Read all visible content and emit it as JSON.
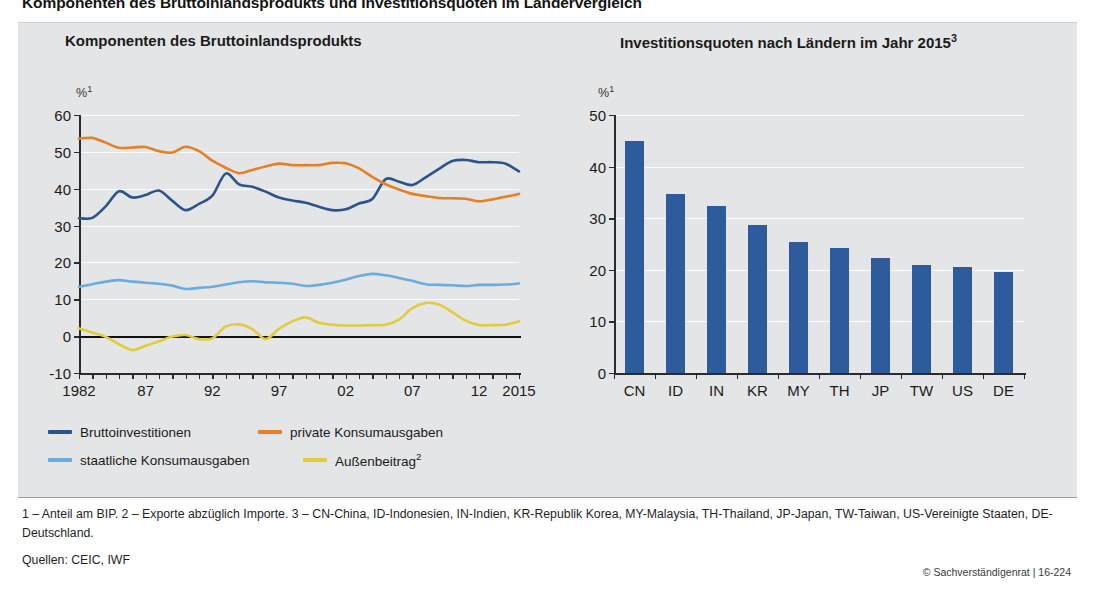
{
  "main_title": "Komponenten des Bruttoinlandsprodukts und Investitionsquoten im Ländervergleich",
  "footnotes": "1 – Anteil am BIP.  2 – Exporte abzüglich Importe.  3 – CN-China, ID-Indonesien, IN-Indien, KR-Republik Korea, MY-Malaysia, TH-Thailand, JP-Japan, TW-Taiwan, US-Vereinigte Staaten, DE-Deutschland.",
  "sources": "Quellen: CEIC, IWF",
  "copyright": "© Sachverständigenrat | 16-224",
  "colors": {
    "navy": "#2d5488",
    "orange": "#e58026",
    "light_blue": "#6cacdc",
    "yellow": "#e0cc3c",
    "bar": "#2e5b9c",
    "panel_bg": "#e4e5e6",
    "grid": "#fbfbfb",
    "axis": "#2b2b2b"
  },
  "legend": {
    "items": [
      {
        "label": "Bruttoinvestitionen",
        "color": "#2d5488"
      },
      {
        "label": "private Konsumausgaben",
        "color": "#e58026"
      },
      {
        "label": "staatliche Konsumausgaben",
        "color": "#6cacdc"
      },
      {
        "label": "Außenbeitrag",
        "sup": "2",
        "color": "#e0cc3c"
      }
    ]
  },
  "chart_data": [
    {
      "type": "line",
      "id": "left",
      "title": "Komponenten des Bruttoinlandsprodukts",
      "unit": "%",
      "unit_sup": "1",
      "xlabel": "",
      "ylabel": "",
      "ylim": [
        -10,
        60
      ],
      "yticks": [
        -10,
        0,
        10,
        20,
        30,
        40,
        50,
        60
      ],
      "xlim": [
        1982,
        2015
      ],
      "xticks": [
        1982,
        1987,
        1992,
        1997,
        2002,
        2007,
        2012,
        2015
      ],
      "xtick_labels": [
        "1982",
        "87",
        "92",
        "97",
        "02",
        "07",
        "12",
        "2015"
      ],
      "grid": true,
      "legend_position": "below",
      "x": [
        1982,
        1983,
        1984,
        1985,
        1986,
        1987,
        1988,
        1989,
        1990,
        1991,
        1992,
        1993,
        1994,
        1995,
        1996,
        1997,
        1998,
        1999,
        2000,
        2001,
        2002,
        2003,
        2004,
        2005,
        2006,
        2007,
        2008,
        2009,
        2010,
        2011,
        2012,
        2013,
        2014,
        2015
      ],
      "series": [
        {
          "name": "Bruttoinvestitionen",
          "color": "#2d5488",
          "values": [
            32.0,
            32.1,
            35.2,
            39.3,
            37.6,
            38.3,
            39.5,
            36.7,
            34.2,
            35.9,
            38.1,
            44.1,
            41.2,
            40.5,
            39.2,
            37.6,
            36.8,
            36.2,
            35.1,
            34.2,
            34.4,
            36.0,
            37.2,
            42.6,
            41.9,
            41.0,
            43.1,
            45.4,
            47.5,
            47.8,
            47.2,
            47.2,
            46.8,
            44.7
          ]
        },
        {
          "name": "private Konsumausgaben",
          "color": "#e58026",
          "values": [
            53.6,
            53.8,
            52.5,
            51.1,
            51.2,
            51.3,
            50.2,
            49.8,
            51.4,
            50.2,
            47.6,
            45.7,
            44.2,
            45.1,
            46.0,
            46.8,
            46.4,
            46.4,
            46.4,
            47.0,
            46.9,
            45.5,
            43.2,
            41.2,
            39.8,
            38.6,
            38.0,
            37.5,
            37.4,
            37.3,
            36.6,
            37.1,
            37.8,
            38.6
          ]
        },
        {
          "name": "staatliche Konsumausgaben",
          "color": "#6cacdc",
          "values": [
            13.4,
            14.1,
            14.8,
            15.2,
            14.8,
            14.5,
            14.2,
            13.7,
            12.8,
            13.1,
            13.4,
            14.0,
            14.6,
            14.9,
            14.6,
            14.5,
            14.2,
            13.6,
            13.9,
            14.5,
            15.3,
            16.3,
            16.9,
            16.5,
            15.8,
            15.0,
            14.1,
            13.9,
            13.8,
            13.6,
            13.9,
            13.9,
            14.0,
            14.3
          ]
        },
        {
          "name": "Außenbeitrag",
          "color": "#e0cc3c",
          "values": [
            2.1,
            1.0,
            -0.2,
            -2.2,
            -3.8,
            -2.6,
            -1.4,
            -0.1,
            0.3,
            -0.8,
            -0.6,
            2.6,
            3.2,
            1.9,
            -0.8,
            2.0,
            4.0,
            5.1,
            3.6,
            3.1,
            2.9,
            2.9,
            3.0,
            3.1,
            4.5,
            7.6,
            9.0,
            8.6,
            6.5,
            4.2,
            3.0,
            3.0,
            3.1,
            4.0
          ]
        }
      ]
    },
    {
      "type": "bar",
      "id": "right",
      "title": "Investitionsquoten nach Ländern im Jahr 2015",
      "title_sup": "3",
      "unit": "%",
      "unit_sup": "1",
      "xlabel": "",
      "ylabel": "",
      "ylim": [
        0,
        50
      ],
      "yticks": [
        0,
        10,
        20,
        30,
        40,
        50
      ],
      "grid": true,
      "categories": [
        "CN",
        "ID",
        "IN",
        "KR",
        "MY",
        "TH",
        "JP",
        "TW",
        "US",
        "DE"
      ],
      "values": [
        45.0,
        34.6,
        32.4,
        28.7,
        25.3,
        24.3,
        22.2,
        21.0,
        20.5,
        19.5
      ]
    }
  ]
}
